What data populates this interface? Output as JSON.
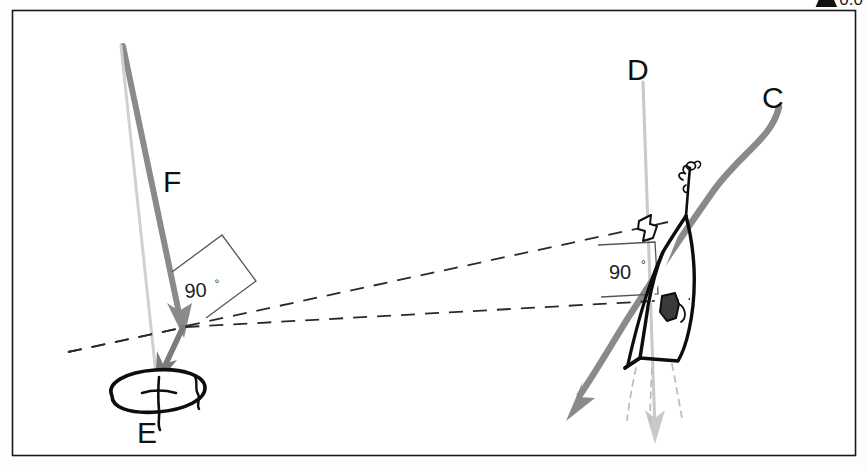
{
  "figure": {
    "type": "hand-drawn-nautical-diagram",
    "title_fragment": "0.0",
    "frame": {
      "color": "#1a1a1a",
      "border_px": 1.5
    },
    "background_color": "#ffffff"
  },
  "labels": {
    "c": "C",
    "d": "D",
    "e": "E",
    "f": "F",
    "angle_left": "90",
    "angle_left_degree": "°",
    "angle_right": "90",
    "angle_right_degree": "°"
  },
  "colors": {
    "ink": "#111111",
    "arrow_dark_gray": "#7b7b7b",
    "arrow_light_gray": "#c3c3c3",
    "dashed": "#2a2a2a",
    "frame": "#1a1a1a",
    "boat_outline": "#0d0d0d",
    "sail_fill": "#3a3a3a"
  },
  "elements": [
    {
      "name": "line-d",
      "label": "D",
      "style": "thin light gray straight line",
      "color": "#c3c3c3"
    },
    {
      "name": "line-c",
      "label": "C",
      "style": "thick gray curved line with arrowhead",
      "color": "#7b7b7b"
    },
    {
      "name": "line-f",
      "label": "F",
      "style": "thick gray straight line with arrowhead",
      "color": "#7b7b7b"
    },
    {
      "name": "mark-e",
      "label": "E",
      "style": "hand drawn ellipse buoy",
      "color": "#0d0d0d"
    },
    {
      "name": "boat",
      "label": "",
      "style": "hand drawn sailboat top view",
      "color": "#0d0d0d"
    },
    {
      "name": "dashed-bearing-upper",
      "label": "",
      "style": "dashed line",
      "color": "#2a2a2a"
    },
    {
      "name": "dashed-bearing-lower",
      "label": "",
      "style": "dashed line",
      "color": "#2a2a2a"
    },
    {
      "name": "right-angle-box-left",
      "label": "90°",
      "style": "square bracket annotation"
    },
    {
      "name": "right-angle-box-right",
      "label": "90°",
      "style": "square bracket annotation"
    },
    {
      "name": "pennant-flag",
      "label": "",
      "style": "small hand drawn flag",
      "color": "#0d0d0d"
    }
  ]
}
